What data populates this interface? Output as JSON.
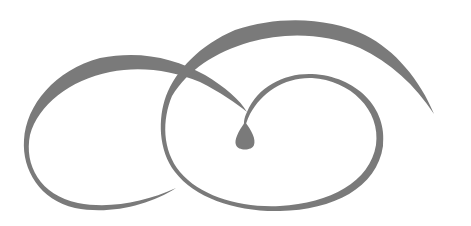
{
  "image": {
    "description": "decorative swirl flourish",
    "background_color": "#ffffff",
    "ink_color": "#7a7a7a"
  },
  "shapes": [
    {
      "name": "left-loop",
      "kind": "swirl"
    },
    {
      "name": "top-arc",
      "kind": "swirl"
    },
    {
      "name": "inner-loop",
      "kind": "swirl"
    },
    {
      "name": "teardrop",
      "kind": "drop"
    }
  ]
}
